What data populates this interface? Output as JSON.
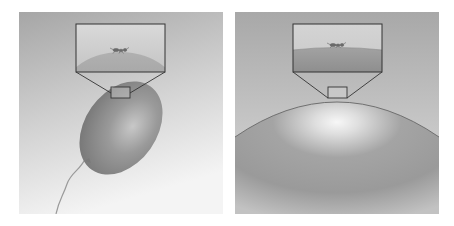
{
  "figure": {
    "panels": [
      {
        "id": "left",
        "subject": "small balloon with string",
        "inset": "magnified view: ant on visibly curved surface",
        "colors": {
          "bg_top": "#a8a8a8",
          "bg_bottom": "#f2f2f2",
          "balloon": "#8a8a8a",
          "highlight": "#c9c9c9",
          "line": "#3a3a3a"
        }
      },
      {
        "id": "right",
        "subject": "large balloon surface",
        "inset": "magnified view: ant on nearly flat surface",
        "colors": {
          "bg_top": "#a9a9a9",
          "bg_bottom": "#d8d8d8",
          "balloon": "#9a9a9a",
          "highlight": "#f5f5f5",
          "line": "#3a3a3a"
        }
      }
    ]
  }
}
